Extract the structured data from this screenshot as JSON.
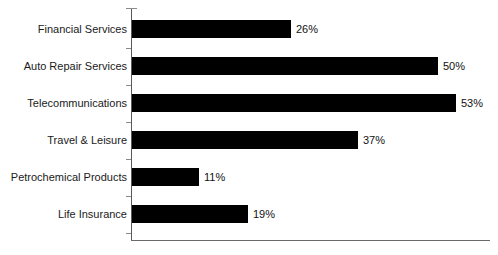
{
  "chart_data": {
    "type": "bar",
    "orientation": "horizontal",
    "title": "",
    "subtitle": "",
    "xlabel": "",
    "ylabel": "",
    "categories": [
      "Financial Services",
      "Auto Repair Services",
      "Telecommunications",
      "Travel & Leisure",
      "Petrochemical Products",
      "Life Insurance"
    ],
    "values": [
      26,
      50,
      53,
      37,
      11,
      19
    ],
    "value_labels": [
      "26%",
      "50%",
      "53%",
      "37%",
      "11%",
      "19%"
    ],
    "unit": "%",
    "xlim": [
      0,
      58
    ],
    "ylim": null,
    "grid": false,
    "legend": null,
    "bar_color": "#000000",
    "axis_color": "#5a5a5a",
    "background_color": "#ffffff",
    "tick_labels": [],
    "annotations": []
  },
  "series_meta": {
    "name": "",
    "bars": [
      {
        "label": "Financial Services",
        "value": 26,
        "value_label": "26%"
      },
      {
        "label": "Auto Repair Services",
        "value": 50,
        "value_label": "50%"
      },
      {
        "label": "Telecommunications",
        "value": 53,
        "value_label": "53%"
      },
      {
        "label": "Travel & Leisure",
        "value": 37,
        "value_label": "37%"
      },
      {
        "label": "Petrochemical Products",
        "value": 11,
        "value_label": "11%"
      },
      {
        "label": "Life Insurance",
        "value": 19,
        "value_label": "19%"
      }
    ]
  }
}
